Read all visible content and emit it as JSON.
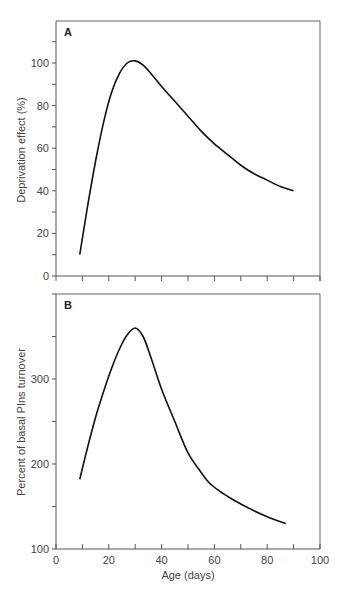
{
  "chart_data": [
    {
      "type": "line",
      "panel": "A",
      "title": "",
      "xlabel": "",
      "ylabel": "Deprivation effect  (%)",
      "xlim": [
        0,
        100
      ],
      "ylim": [
        0,
        115
      ],
      "yticks": [
        0,
        20,
        40,
        60,
        80,
        100
      ],
      "xticks": [
        0,
        10,
        20,
        30,
        40,
        50,
        60,
        70,
        80,
        90,
        100
      ],
      "grid": false,
      "x": [
        9,
        12,
        15,
        18,
        21,
        24,
        27,
        30,
        33,
        36,
        40,
        45,
        50,
        55,
        60,
        65,
        70,
        75,
        80,
        85,
        90
      ],
      "series": [
        {
          "name": "Deprivation effect",
          "values": [
            10,
            33,
            54,
            72,
            86,
            95,
            100,
            101,
            99,
            95,
            89,
            82,
            75,
            68,
            62,
            57,
            52,
            48,
            45,
            42,
            40
          ]
        }
      ]
    },
    {
      "type": "line",
      "panel": "B",
      "title": "",
      "xlabel": "Age (days)",
      "ylabel": "Percent of basal PIns turnover",
      "xlim": [
        0,
        100
      ],
      "ylim": [
        100,
        400
      ],
      "yticks": [
        100,
        200,
        300
      ],
      "xticks": [
        0,
        20,
        40,
        60,
        80,
        100
      ],
      "xticklabels": [
        "0",
        "20",
        "40",
        "60",
        "80",
        "100"
      ],
      "grid": false,
      "x": [
        9,
        12,
        15,
        18,
        21,
        24,
        27,
        30,
        33,
        36,
        40,
        45,
        50,
        55,
        58,
        62,
        66,
        70,
        75,
        80,
        87
      ],
      "series": [
        {
          "name": "PIns turnover",
          "values": [
            182,
            220,
            255,
            285,
            312,
            335,
            352,
            360,
            350,
            325,
            288,
            250,
            213,
            190,
            178,
            168,
            160,
            153,
            145,
            138,
            130
          ]
        }
      ]
    }
  ],
  "panels": {
    "a": {
      "letter": "A",
      "ylabel": "Deprivation effect  (%)",
      "ytick_labels": [
        "0",
        "20",
        "40",
        "60",
        "80",
        "100"
      ]
    },
    "b": {
      "letter": "B",
      "ylabel": "Percent of basal PIns turnover",
      "ytick_labels": [
        "100",
        "200",
        "300"
      ],
      "xlabel": "Age (days)",
      "xtick_labels": [
        "0",
        "20",
        "40",
        "60",
        "80",
        "100"
      ]
    }
  }
}
